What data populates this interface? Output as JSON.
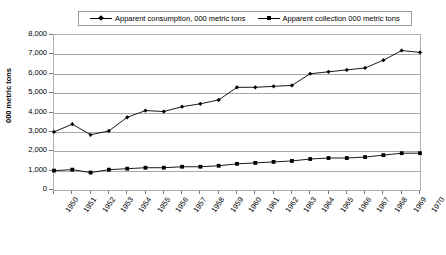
{
  "legend": {
    "position": "top",
    "entries": [
      {
        "label": "Apparent consumption, 000 metric tons",
        "marker": "diamond",
        "color": "#000000"
      },
      {
        "label": "Apparent collection 000 metric tons",
        "marker": "square",
        "color": "#000000"
      }
    ]
  },
  "axes": {
    "ylabel": "000 metric tons",
    "ytick_labels": [
      "8,000",
      "7,000",
      "6,000",
      "5,000",
      "4,000",
      "3,000",
      "2,000",
      "1,000",
      "0"
    ],
    "xtick_labels": [
      "1950",
      "1951",
      "1952",
      "1953",
      "1954",
      "1955",
      "1956",
      "1957",
      "1958",
      "1959",
      "1960",
      "1961",
      "1962",
      "1963",
      "1964",
      "1965",
      "1966",
      "1967",
      "1968",
      "1969",
      "1970"
    ]
  },
  "chart_data": {
    "type": "line",
    "title": "",
    "xlabel": "",
    "ylabel": "000 metric tons",
    "ylim": [
      0,
      8000
    ],
    "ytick_step": 1000,
    "grid": true,
    "legend_position": "top",
    "x": [
      1950,
      1951,
      1952,
      1953,
      1954,
      1955,
      1956,
      1957,
      1958,
      1959,
      1960,
      1961,
      1962,
      1963,
      1964,
      1965,
      1966,
      1967,
      1968,
      1969,
      1970
    ],
    "series": [
      {
        "name": "Apparent consumption, 000 metric tons",
        "marker": "diamond",
        "color": "#000000",
        "values": [
          3000,
          3400,
          2850,
          3050,
          3750,
          4100,
          4050,
          4300,
          4450,
          4650,
          5300,
          5300,
          5350,
          5400,
          6000,
          6100,
          6200,
          6300,
          6700,
          7200,
          7100
        ]
      },
      {
        "name": "Apparent collection 000 metric tons",
        "marker": "square",
        "color": "#000000",
        "values": [
          1000,
          1050,
          900,
          1050,
          1100,
          1150,
          1150,
          1200,
          1200,
          1250,
          1350,
          1400,
          1450,
          1500,
          1600,
          1650,
          1650,
          1700,
          1800,
          1900,
          1900
        ]
      }
    ]
  }
}
